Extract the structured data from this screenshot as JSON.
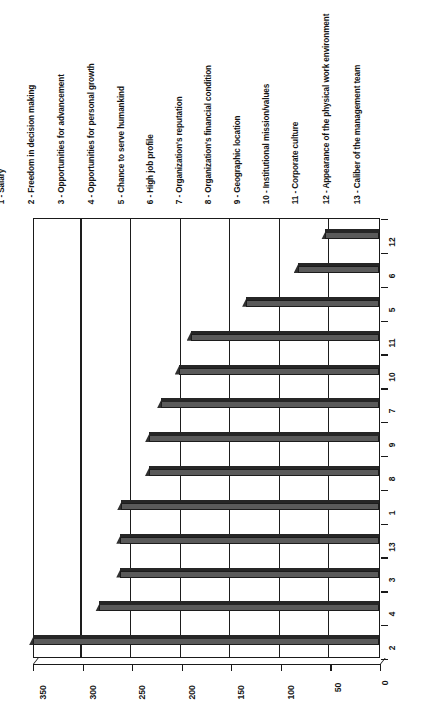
{
  "chart_data": {
    "type": "bar",
    "orientation": "horizontal",
    "title": "",
    "xlabel": "",
    "ylabel": "",
    "xlim": [
      0,
      350
    ],
    "grid": true,
    "legend_position": "top",
    "tick_labels": [
      "350",
      "300",
      "250",
      "200",
      "150",
      "100",
      "50",
      "0"
    ],
    "tick_values": [
      350,
      300,
      250,
      200,
      150,
      100,
      50,
      0
    ],
    "categories": [
      "12",
      "6",
      "5",
      "11",
      "10",
      "7",
      "9",
      "8",
      "1",
      "13",
      "3",
      "4",
      "2"
    ],
    "values": [
      53,
      81,
      133,
      189,
      201,
      219,
      231,
      231,
      259,
      260,
      260,
      281,
      348
    ],
    "bars": [
      {
        "category": "12",
        "value": 53
      },
      {
        "category": "6",
        "value": 81
      },
      {
        "category": "5",
        "value": 133
      },
      {
        "category": "11",
        "value": 189
      },
      {
        "category": "10",
        "value": 201
      },
      {
        "category": "7",
        "value": 219
      },
      {
        "category": "9",
        "value": 231
      },
      {
        "category": "8",
        "value": 231
      },
      {
        "category": "1",
        "value": 259
      },
      {
        "category": "13",
        "value": 260
      },
      {
        "category": "3",
        "value": 260
      },
      {
        "category": "4",
        "value": 281
      },
      {
        "category": "2",
        "value": 348
      }
    ],
    "legend": [
      "1 - Salary",
      "2 - Freedom in decision making",
      "3 - Opportunities for advancement",
      "4 - Opportunities for personal growth",
      "5 - Chance to serve humankind",
      "6 - High job profile",
      "7 - Organization's reputation",
      "8 - Organization's financial condition",
      "9 - Geographic location",
      "10 - Institutional mission/values",
      "11 - Corporate culture",
      "12 -  Appearance of the physical work  environment",
      "13 - Caliber of the management team"
    ],
    "colors": {
      "bar_face": "#5a5a5a",
      "bar_top": "#262626",
      "bar_side": "#303030",
      "axis": "#1a1a1a",
      "background": "#ffffff"
    }
  }
}
